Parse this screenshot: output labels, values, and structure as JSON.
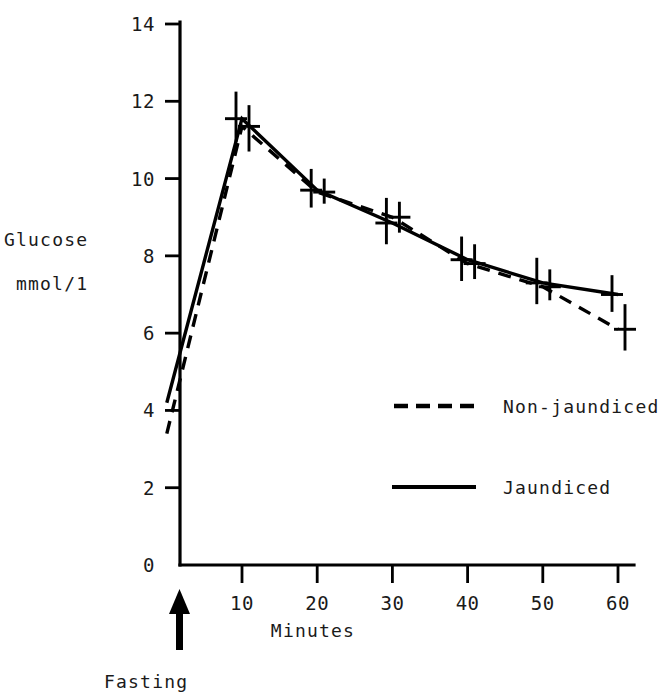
{
  "chart_data": {
    "type": "line",
    "title": "",
    "subtitle": "",
    "xlabel": "Minutes",
    "ylabel_line1": "Glucose",
    "ylabel_line2": "mmol/1",
    "x": [
      0,
      10,
      20,
      30,
      40,
      50,
      60
    ],
    "xlim": [
      -3,
      62
    ],
    "ylim": [
      0,
      14
    ],
    "xticks": [
      10,
      20,
      30,
      40,
      50,
      60
    ],
    "xticklabels": [
      "10",
      "20",
      "30",
      "40",
      "50",
      "60"
    ],
    "yticks": [
      0,
      2,
      4,
      6,
      8,
      10,
      12,
      14
    ],
    "yticklabels": [
      "0",
      "2",
      "4",
      "6",
      "8",
      "10",
      "12",
      "14"
    ],
    "grid": false,
    "legend_position": "center-right",
    "annotations": [
      {
        "name": "fasting-arrow-label",
        "text": "Fasting",
        "x": 0,
        "note": "upward arrow pointing at the fasting time point on the x-axis"
      }
    ],
    "series": [
      {
        "name": "Jaundiced",
        "style": "solid",
        "values": [
          4.2,
          11.55,
          9.7,
          8.85,
          7.9,
          7.3,
          7.0
        ],
        "errors_low": [
          4.2,
          10.95,
          9.25,
          8.3,
          7.35,
          6.75,
          6.55
        ],
        "errors_high": [
          4.2,
          12.25,
          10.25,
          9.5,
          8.5,
          7.95,
          7.5
        ]
      },
      {
        "name": "Non-jaundiced",
        "style": "dashed",
        "values": [
          3.4,
          11.35,
          9.65,
          9.0,
          7.8,
          7.2,
          6.1
        ],
        "errors_low": [
          3.4,
          10.7,
          9.35,
          8.6,
          7.4,
          6.85,
          5.55
        ],
        "errors_high": [
          3.4,
          11.9,
          10.0,
          9.4,
          8.3,
          7.65,
          6.75
        ]
      }
    ]
  },
  "legend": {
    "entries": [
      {
        "label": "Non-jaundiced",
        "style": "dashed"
      },
      {
        "label": "Jaundiced",
        "style": "solid"
      }
    ]
  },
  "axes": {
    "x_title": "Minutes",
    "y_title_line1": "Glucose",
    "y_title_line2": "mmol/1"
  },
  "colors": {
    "ink": "#000000",
    "text": "#1a1a1a",
    "background": "#ffffff"
  }
}
